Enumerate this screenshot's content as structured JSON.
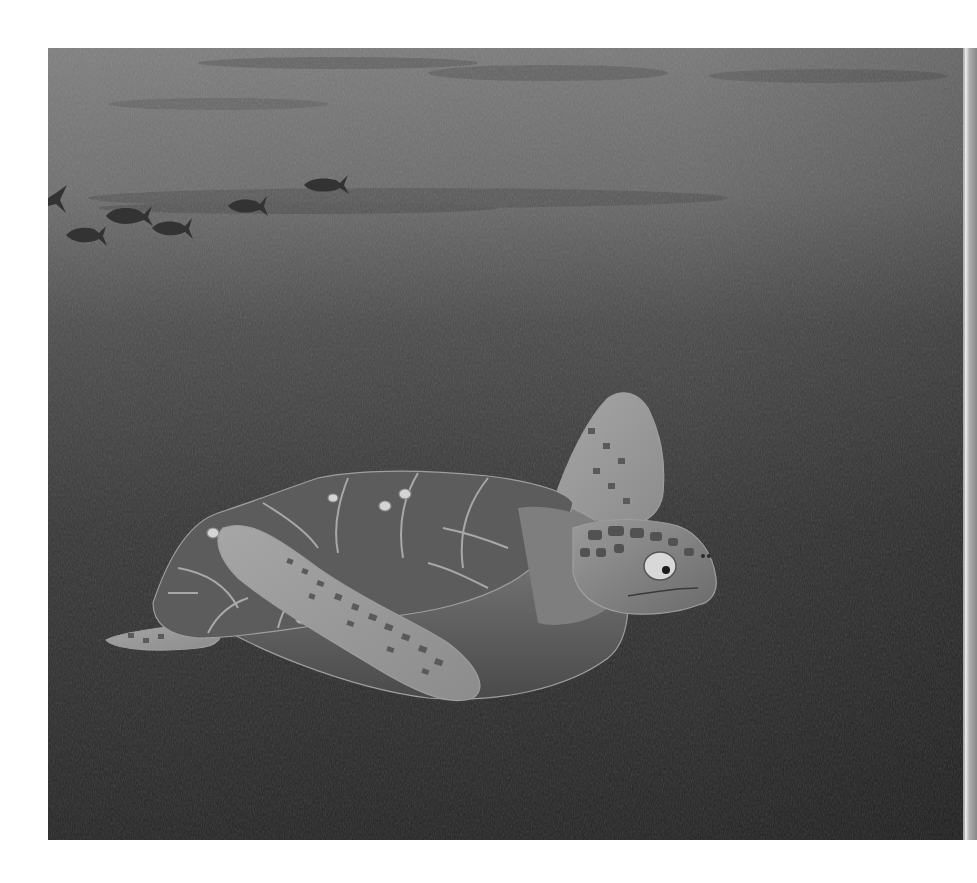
{
  "scene": {
    "subject": "sea turtle swimming underwater",
    "background": {
      "top_color": "#7c7c7c",
      "mid_color": "#4a4a4a",
      "bottom_color": "#262626",
      "page_color": "#ffffff"
    },
    "fish_school": {
      "count": 6,
      "color": "#3a3a3a",
      "direction": "left"
    },
    "turtle": {
      "shell_color": "#5e5e5e",
      "skin_color": "#8a8a8a",
      "scute_color": "#4c4c4c",
      "barnacle_color": "#cfcfcf"
    }
  }
}
